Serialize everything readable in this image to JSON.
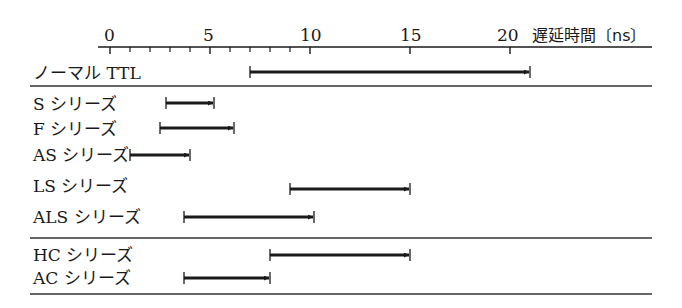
{
  "chart_data": {
    "type": "range-bar",
    "title": "",
    "xlabel": "遅延時間〔ns〕",
    "ylabel": "",
    "xlim": [
      0,
      22
    ],
    "x_ticks_major": [
      0,
      5,
      10,
      15,
      20
    ],
    "x_ticks_minor_step": 1,
    "x_ticks_minor_range": [
      0,
      10
    ],
    "grid": false,
    "groups": [
      {
        "name": "normal",
        "series": [
          {
            "label": "ノーマルTTL",
            "start": 7,
            "end": 21
          }
        ]
      },
      {
        "name": "schottky",
        "series": [
          {
            "label": "Sシリーズ",
            "start": 3,
            "end": 5
          },
          {
            "label": "Fシリーズ",
            "start": 2.5,
            "end": 6.2
          },
          {
            "label": "ASシリーズ",
            "start": 1,
            "end": 4
          },
          {
            "label": "LSシリーズ",
            "start": 9,
            "end": 15
          },
          {
            "label": "ALSシリーズ",
            "start": 4,
            "end": 10
          }
        ]
      },
      {
        "name": "cmos",
        "series": [
          {
            "label": "HCシリーズ",
            "start": 8,
            "end": 15
          },
          {
            "label": "ACシリーズ",
            "start": 4,
            "end": 8
          }
        ]
      }
    ],
    "legend": "none"
  },
  "axis": {
    "title": "遅延時間〔ns〕",
    "ticks": [
      "0",
      "5",
      "10",
      "15",
      "20"
    ]
  },
  "rows": [
    {
      "label": "ノーマル TTL",
      "start": 7,
      "end": 21
    },
    {
      "label": "S シリーズ",
      "start": 2.8,
      "end": 5.2
    },
    {
      "label": "F シリーズ",
      "start": 2.5,
      "end": 6.2
    },
    {
      "label": "AS シリーズ",
      "start": 1,
      "end": 4
    },
    {
      "label": "LS シリーズ",
      "start": 9,
      "end": 15
    },
    {
      "label": "ALS シリーズ",
      "start": 3.7,
      "end": 10.2
    },
    {
      "label": "HC シリーズ",
      "start": 8,
      "end": 15
    },
    {
      "label": "AC シリーズ",
      "start": 3.7,
      "end": 8
    }
  ],
  "colors": {
    "ink": "#1a1a1a",
    "background": "#ffffff"
  }
}
